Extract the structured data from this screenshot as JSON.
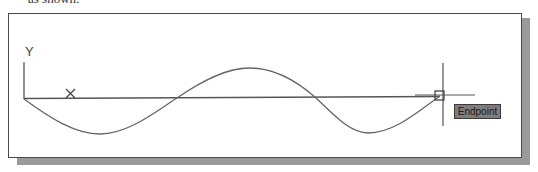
{
  "caption_fragment": "as shown.",
  "drawing": {
    "y_axis_label": "Y",
    "x_marker_label": "X",
    "snap_tooltip": "Endpoint",
    "curve": {
      "type": "sine",
      "start": [
        24,
        99
      ],
      "trough1": [
        100,
        134
      ],
      "crossing1": [
        177,
        98
      ],
      "peak": [
        250,
        68
      ],
      "crossing2": [
        316,
        98
      ],
      "trough2": [
        368,
        133
      ],
      "end": [
        440,
        96
      ]
    },
    "colors": {
      "line": "#555555",
      "frame": "#4a4a4a",
      "shadow": "#9a9a9a",
      "tooltip_bg": "#7d7d7d"
    }
  }
}
